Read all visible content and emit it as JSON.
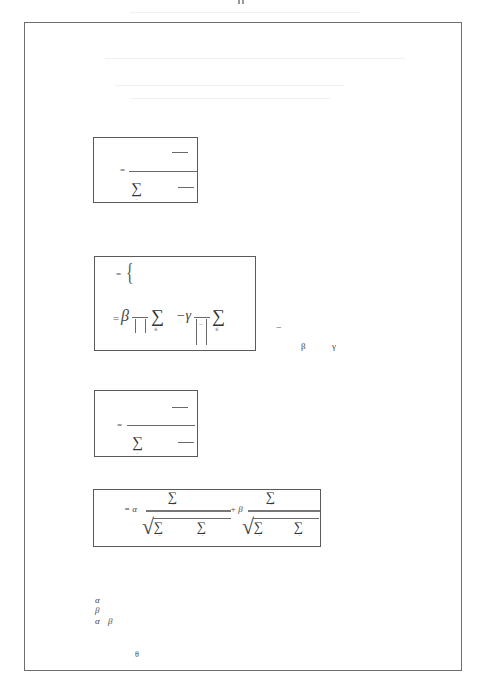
{
  "page": {
    "width": 484,
    "height": 694,
    "frame_color": "#6e6e6e",
    "box_border_color": "#5a5a5a"
  },
  "equations": [
    {
      "id": "eq1",
      "equals": "=",
      "sigma": "∑",
      "sigma_sub": "="
    },
    {
      "id": "eq2",
      "line1_equals": "=",
      "brace": "{",
      "line2_equals": "=",
      "beta": "β",
      "sigma_a": "∑",
      "sigma_a_sub": "∈",
      "minus_gamma": "−γ",
      "bar_mark": "−",
      "sigma_b": "∑",
      "sigma_b_sub": "∈"
    },
    {
      "id": "eq3",
      "equals": "=",
      "sigma": "∑",
      "sigma_sub": "="
    },
    {
      "id": "eq4",
      "equals_alpha": "= α",
      "plus_beta": "+ β",
      "sigma": "∑",
      "sigma_sub": "=",
      "sqrt": "√"
    }
  ],
  "side_note": {
    "dash": "−",
    "beta": "β",
    "gamma": "γ"
  },
  "symbol_list": {
    "line1": "α",
    "line2": "β",
    "line3_a": "α",
    "line3_b": "β"
  },
  "footer_symbol": "θ"
}
